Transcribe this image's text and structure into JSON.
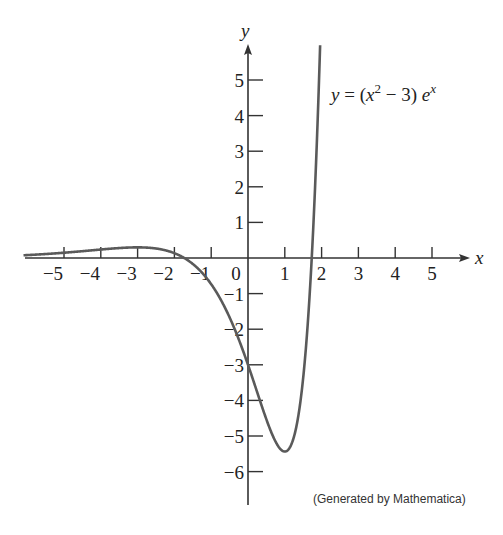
{
  "chart_data": {
    "type": "line",
    "title": "",
    "function": "y = (x^2 - 3) e^x",
    "equation_label": {
      "lhs": "y = (x",
      "sup1": "2",
      "mid": " − 3) e",
      "sup2": "x"
    },
    "xlabel": "x",
    "ylabel": "y",
    "xlim": [
      -6.1,
      6.1
    ],
    "ylim": [
      -6.8,
      6.0
    ],
    "x_ticks": [
      -5,
      -4,
      -3,
      -2,
      -1,
      0,
      1,
      2,
      3,
      4,
      5
    ],
    "x_tick_labels": [
      "−5",
      "−4",
      "−3",
      "−2",
      "−1",
      "0",
      "1",
      "2",
      "3",
      "4",
      "5"
    ],
    "y_ticks": [
      5,
      4,
      3,
      2,
      1,
      -1,
      -2,
      -3,
      -4,
      -5,
      -6
    ],
    "y_tick_labels": [
      "5",
      "4",
      "3",
      "2",
      "1",
      "−1",
      "−2",
      "−3",
      "−4",
      "−5",
      "−6"
    ],
    "grid": false,
    "series": [
      {
        "name": "y = (x^2 - 3) e^x",
        "x": [
          -6,
          -5,
          -4,
          -3,
          -2,
          -1.732,
          -1,
          0,
          1,
          1.732,
          1.9
        ],
        "y": [
          0.08,
          0.15,
          0.24,
          0.3,
          0.14,
          0,
          -0.74,
          -3,
          -5.44,
          0,
          4.08
        ]
      }
    ],
    "annotations": [
      "(Generated by Mathematica)"
    ],
    "color": "#5a5a5a"
  },
  "credit": "(Generated by Mathematica)"
}
